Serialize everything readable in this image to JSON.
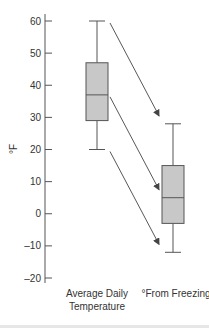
{
  "chart_data": {
    "type": "boxplot",
    "title": "",
    "xlabel": "",
    "ylabel": "°F",
    "ylim": [
      -20,
      60
    ],
    "yticks": [
      60,
      50,
      40,
      30,
      20,
      10,
      0,
      -10,
      -20
    ],
    "ytick_labels": [
      "60",
      "50",
      "40",
      "30",
      "20",
      "10",
      "0",
      "–10",
      "–20"
    ],
    "grid": false,
    "categories": [
      "Average Daily Temperature",
      "°From Freezing"
    ],
    "category_label_lines": [
      [
        "Average Daily",
        "Temperature"
      ],
      [
        "°From Freezing"
      ]
    ],
    "series": [
      {
        "name": "Average Daily Temperature",
        "min": 20,
        "q1": 29,
        "median": 37,
        "q3": 47,
        "max": 60
      },
      {
        "name": "°From Freezing",
        "min": -12,
        "q1": -3,
        "median": 5,
        "q3": 15,
        "max": 28
      }
    ],
    "annotations": [
      {
        "type": "arrow",
        "from": "Average Daily Temperature max (60)",
        "to": "°From Freezing max (28)"
      },
      {
        "type": "arrow",
        "from": "Average Daily Temperature median (37)",
        "to": "°From Freezing median (5)"
      },
      {
        "type": "arrow",
        "from": "Average Daily Temperature min (20)",
        "to": "°From Freezing min (-12)"
      }
    ],
    "colors": {
      "box_fill": "#c8c8c8",
      "stroke": "#555555",
      "arrow": "#444444",
      "text": "#333333"
    }
  }
}
